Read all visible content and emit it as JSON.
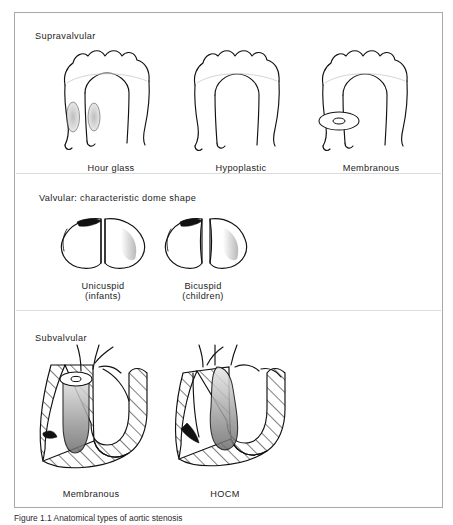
{
  "figure": {
    "sections": [
      {
        "id": "supravalvular",
        "title": "Supravalvular",
        "items": [
          {
            "label": "Hour glass",
            "sublabel": ""
          },
          {
            "label": "Hypoplastic",
            "sublabel": ""
          },
          {
            "label": "Membranous",
            "sublabel": ""
          }
        ]
      },
      {
        "id": "valvular",
        "title": "Valvular: characteristic dome shape",
        "items": [
          {
            "label": "Unicuspid",
            "sublabel": "(infants)"
          },
          {
            "label": "Bicuspid",
            "sublabel": "(children)"
          }
        ]
      },
      {
        "id": "subvalvular",
        "title": "Subvalvular",
        "items": [
          {
            "label": "Membranous",
            "sublabel": ""
          },
          {
            "label": "HOCM",
            "sublabel": ""
          }
        ]
      }
    ]
  },
  "caption": {
    "text": "Figure  1.1  Anatomical types of aortic stenosis"
  },
  "colors": {
    "ink": "#111111",
    "frame": "#a8a8a8",
    "divider": "#dcdcdc",
    "background": "#ffffff"
  }
}
